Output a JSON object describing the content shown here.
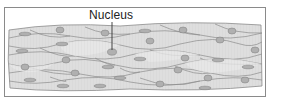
{
  "diagram": {
    "labels": [
      {
        "text": "Nucleus",
        "points_to": "cell nucleus"
      }
    ],
    "colors": {
      "frame": "#8a8a8a",
      "cell_fill": "#dcdcdc",
      "cell_fill_alt": "#e6e6e6",
      "cell_border": "#8c8c8c",
      "nucleus": "#a9a9a9",
      "label_text": "#222222",
      "leader_line": "#333333"
    }
  }
}
